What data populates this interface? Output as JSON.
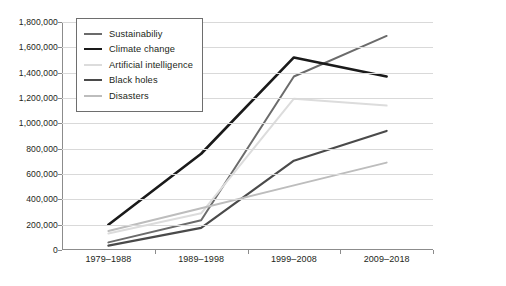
{
  "chart_data": {
    "type": "line",
    "title": "",
    "xlabel": "",
    "ylabel": "",
    "categories": [
      "1979–1988",
      "1989–1998",
      "1999–2008",
      "2009–2018"
    ],
    "ylim": [
      0,
      1800000
    ],
    "ytick_step": 200000,
    "ytick_labels": [
      "1,800,000",
      "1,600,000",
      "1,400,000",
      "1,200,000",
      "1,000,000",
      "800,000",
      "600,000",
      "400,000",
      "200,000",
      "0"
    ],
    "ytick_values": [
      1800000,
      1600000,
      1400000,
      1200000,
      1000000,
      800000,
      600000,
      400000,
      200000,
      0
    ],
    "grid": true,
    "legend_position": "top-left-inside",
    "series": [
      {
        "name": "Sustainabiliy",
        "color": "#6b6b6b",
        "width": 2.0,
        "values": [
          60000,
          235000,
          1370000,
          1690000
        ]
      },
      {
        "name": "Climate change",
        "color": "#1a1a1a",
        "width": 2.6,
        "values": [
          200000,
          760000,
          1520000,
          1370000
        ]
      },
      {
        "name": "Artificial intelligence",
        "color": "#dcdcdc",
        "width": 2.0,
        "values": [
          130000,
          290000,
          1195000,
          1140000
        ]
      },
      {
        "name": "Black holes",
        "color": "#4a4a4a",
        "width": 2.2,
        "values": [
          35000,
          175000,
          705000,
          940000
        ]
      },
      {
        "name": "Disasters",
        "color": "#bdbdbd",
        "width": 2.0,
        "values": [
          150000,
          330000,
          510000,
          690000
        ]
      }
    ]
  }
}
